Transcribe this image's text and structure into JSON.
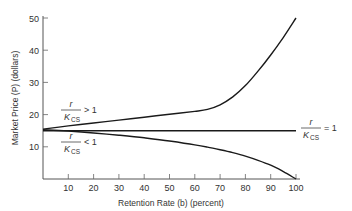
{
  "chart_data": {
    "type": "line",
    "title": "",
    "xlabel": "Retention Rate (b) (percent)",
    "ylabel": "Market Price (P) (dollars)",
    "xlim": [
      0,
      100
    ],
    "ylim": [
      0,
      50
    ],
    "xticks": [
      10,
      20,
      30,
      40,
      50,
      60,
      70,
      80,
      90,
      100
    ],
    "yticks": [
      10,
      20,
      30,
      40,
      50
    ],
    "grid": false,
    "legend": "none (inline annotations)",
    "x": [
      0,
      10,
      20,
      30,
      40,
      50,
      60,
      65,
      70,
      75,
      80,
      85,
      90,
      95,
      100
    ],
    "series": [
      {
        "name": "r/K_CS > 1",
        "values": [
          15.5,
          16.5,
          17.4,
          18.3,
          19.2,
          20.1,
          21.0,
          21.6,
          23.0,
          25.5,
          29.0,
          33.5,
          38.5,
          44.0,
          50.0
        ]
      },
      {
        "name": "r/K_CS = 1",
        "values": [
          15,
          15,
          15,
          15,
          15,
          15,
          15,
          15,
          15,
          15,
          15,
          15,
          15,
          15,
          15
        ]
      },
      {
        "name": "r/K_CS < 1",
        "values": [
          15.3,
          14.9,
          14.3,
          13.6,
          12.8,
          11.8,
          10.6,
          9.9,
          9.1,
          8.2,
          7.1,
          5.8,
          4.3,
          2.3,
          0.0
        ]
      }
    ],
    "annotations": [
      {
        "text": "r/K_CS > 1",
        "near": "upper line, left"
      },
      {
        "text": "r/K_CS < 1",
        "near": "lower line, left"
      },
      {
        "text": "r/K_CS = 1",
        "near": "flat line, right end"
      }
    ]
  },
  "axes": {
    "x_title": "Retention Rate (b) (percent)",
    "y_title": "Market Price (P) (dollars)",
    "x_ticks": [
      "10",
      "20",
      "30",
      "40",
      "50",
      "60",
      "70",
      "80",
      "90",
      "100"
    ],
    "y_ticks": [
      "10",
      "20",
      "30",
      "40",
      "50"
    ]
  },
  "labels": {
    "upper": {
      "num": "r",
      "den": "K",
      "sub": "CS",
      "rel": "> 1"
    },
    "lower": {
      "num": "r",
      "den": "K",
      "sub": "CS",
      "rel": "< 1"
    },
    "flat": {
      "num": "r",
      "den": "K",
      "sub": "CS",
      "rel": "= 1"
    }
  }
}
